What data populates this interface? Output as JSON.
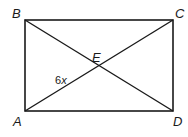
{
  "diagram": {
    "shape": "rectangle",
    "vertices": {
      "A": {
        "label": "A",
        "x": 25,
        "y": 111
      },
      "B": {
        "label": "B",
        "x": 25,
        "y": 20
      },
      "C": {
        "label": "C",
        "x": 173,
        "y": 20
      },
      "D": {
        "label": "D",
        "x": 173,
        "y": 111
      }
    },
    "intersection": {
      "label": "E",
      "x": 97,
      "y": 66
    },
    "diagonals": [
      "AC",
      "BD"
    ],
    "segment_label": {
      "segment": "AE",
      "coef": "6",
      "var": "x"
    },
    "stroke_color": "#1a1a1a"
  }
}
